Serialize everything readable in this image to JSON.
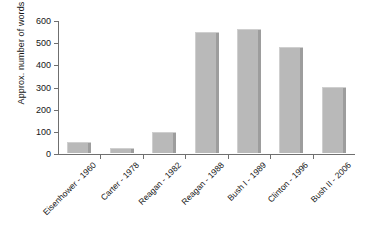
{
  "chart_data": {
    "type": "bar",
    "title": "",
    "xlabel": "",
    "ylabel": "Approx. number of words",
    "categories": [
      "Eisenhower - 1960",
      "Carter - 1978",
      "Reagan - 1982",
      "Reagan - 1988",
      "Bush I - 1989",
      "Clinton - 1996",
      "Bush II - 2006"
    ],
    "values": [
      50,
      22,
      95,
      545,
      560,
      480,
      298
    ],
    "ylim": [
      0,
      600
    ],
    "yticks": [
      0,
      100,
      200,
      300,
      400,
      500,
      600
    ],
    "ytick_labels": [
      "0",
      "100",
      "200",
      "300",
      "400",
      "500",
      "600"
    ],
    "grid": false,
    "legend": false,
    "bar_color": "#b9b9b9",
    "bar_shade_color": "#9d9d9d",
    "axis_color": "#6f6f6f",
    "background": "#ffffff"
  }
}
